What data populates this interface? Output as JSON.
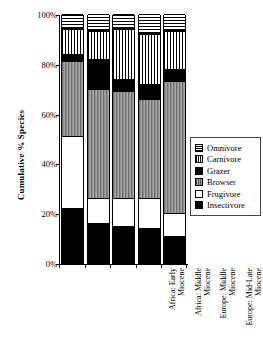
{
  "chart_data": {
    "type": "bar",
    "stacked": true,
    "title": "",
    "xlabel": "",
    "ylabel": "Cumulative % Species",
    "ylim": [
      0,
      100
    ],
    "yticks": [
      "0%",
      "20%",
      "40%",
      "60%",
      "80%",
      "100%"
    ],
    "ytick_values": [
      0,
      20,
      40,
      60,
      80,
      100
    ],
    "grid": false,
    "legend_position": "right",
    "categories": [
      "Africa: Early Miocene",
      "Africa: Middle Miocene",
      "Europe: Middle Miocene",
      "Europe: Mid-Late Miocene",
      "China: Late Miocene"
    ],
    "series": [
      {
        "name": "Insectivore",
        "pattern": "solid-black",
        "values": [
          22,
          16,
          15,
          14,
          11
        ]
      },
      {
        "name": "Frugivore",
        "pattern": "solid-white",
        "values": [
          29,
          10,
          11,
          12,
          9
        ]
      },
      {
        "name": "Browser",
        "pattern": "gray-vertical",
        "values": [
          30,
          44,
          43,
          40,
          53
        ]
      },
      {
        "name": "Grazer",
        "pattern": "solid-black",
        "values": [
          3,
          12,
          5,
          6,
          5
        ]
      },
      {
        "name": "Carnivore",
        "pattern": "vertical-stripes",
        "values": [
          10,
          11,
          20,
          20,
          15
        ]
      },
      {
        "name": "Omnivore",
        "pattern": "horizontal-stripes",
        "values": [
          6,
          7,
          6,
          8,
          7
        ]
      }
    ],
    "cumulative_tops": {
      "Africa: Early Miocene": [
        22,
        51,
        81,
        84,
        94,
        100
      ],
      "Africa: Middle Miocene": [
        16,
        26,
        70,
        82,
        93,
        100
      ],
      "Europe: Middle Miocene": [
        15,
        26,
        69,
        74,
        94,
        100
      ],
      "Europe: Mid-Late Miocene": [
        14,
        26,
        66,
        72,
        92,
        100
      ],
      "China: Late Miocene": [
        11,
        20,
        73,
        78,
        93,
        100
      ]
    }
  },
  "legend": {
    "items": [
      {
        "label": "Omnivore",
        "key": "omnivore"
      },
      {
        "label": "Carnivore",
        "key": "carnivore"
      },
      {
        "label": "Grazer",
        "key": "grazer"
      },
      {
        "label": "Browser",
        "key": "browser"
      },
      {
        "label": "Frugivore",
        "key": "frugivore"
      },
      {
        "label": "Insectivore",
        "key": "insectivore"
      }
    ]
  },
  "category_lines": [
    [
      "Africa: Early",
      "Miocene"
    ],
    [
      "Africa: Middle",
      "Miocene"
    ],
    [
      "Europe: Middle",
      "Miocene"
    ],
    [
      "Europe: Mid-Late",
      "Miocene"
    ],
    [
      "China: Late",
      "Miocene"
    ]
  ]
}
